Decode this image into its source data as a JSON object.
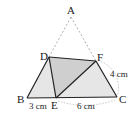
{
  "diagram": {
    "points": {
      "A": {
        "label": "A",
        "x": 71,
        "y": 17
      },
      "B": {
        "label": "B",
        "x": 27,
        "y": 98
      },
      "C": {
        "label": "C",
        "x": 117,
        "y": 97
      },
      "D": {
        "label": "D",
        "x": 49,
        "y": 57
      },
      "E": {
        "label": "E",
        "x": 56,
        "y": 98
      },
      "F": {
        "label": "F",
        "x": 96,
        "y": 61
      }
    },
    "measurements": {
      "BE": "3 cm",
      "EC": "6 cm",
      "FC": "4 cm"
    },
    "colors": {
      "light_fill": "#e6e6e6",
      "dark_fill": "#cfcfcf",
      "line": "#222222",
      "dashed": "#999999"
    }
  }
}
